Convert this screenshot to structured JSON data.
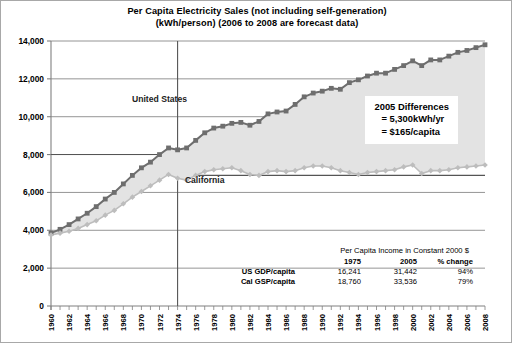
{
  "title": {
    "line1": "Per Capita Electricity Sales (not including self-generation)",
    "line2": "(kWh/person) (2006 to 2008 are forecast data)"
  },
  "callout": {
    "line1": "2005 Differences",
    "line2": "= 5,300kWh/yr",
    "line3": "= $165/capita"
  },
  "income_table": {
    "caption": "Per Capita Income in Constant 2000 $",
    "headers": [
      "1975",
      "2005",
      "% change"
    ],
    "rows": [
      {
        "label": "US GDP/capita",
        "v1975": "16,241",
        "v2005": "31,442",
        "change": "94%"
      },
      {
        "label": "Cal GSP/capita",
        "v1975": "18,760",
        "v2005": "33,536",
        "change": "79%"
      }
    ]
  },
  "colors": {
    "us_series": "#6e6e6e",
    "ca_series": "#bdbdbd",
    "fill_between": "#e3e3e3",
    "axis": "#808080",
    "gridline": "#7a7a7a",
    "frame": "#a8a8a8",
    "text": "#000000"
  },
  "chart_data": {
    "type": "line",
    "title": "Per Capita Electricity Sales (not including self-generation) (kWh/person) (2006 to 2008 are forecast data)",
    "xlabel": "",
    "ylabel": "",
    "xlim": [
      1960,
      2008
    ],
    "ylim": [
      0,
      14000
    ],
    "ytick_step": 2000,
    "yticks": [
      "0",
      "2,000",
      "4,000",
      "6,000",
      "8,000",
      "10,000",
      "12,000",
      "14,000"
    ],
    "xtick_step": 2,
    "xticks": [
      "1960",
      "1962",
      "1964",
      "1966",
      "1968",
      "1970",
      "1972",
      "1974",
      "1976",
      "1978",
      "1980",
      "1982",
      "1984",
      "1986",
      "1988",
      "1990",
      "1992",
      "1994",
      "1996",
      "1998",
      "2000",
      "2002",
      "2004",
      "2006",
      "2008"
    ],
    "grid": "horizontal-partial",
    "legend": "inline-annotations",
    "annotations": [
      {
        "text": "United States",
        "x": 1972,
        "y": 10800
      },
      {
        "text": "California",
        "x": 1977,
        "y": 6500
      }
    ],
    "reference_lines": [
      {
        "orientation": "vertical",
        "x": 1974
      },
      {
        "orientation": "horizontal",
        "y": 8000
      },
      {
        "orientation": "horizontal",
        "y": 6900,
        "x_from": 1976,
        "x_to": 2008
      }
    ],
    "x": [
      1960,
      1961,
      1962,
      1963,
      1964,
      1965,
      1966,
      1967,
      1968,
      1969,
      1970,
      1971,
      1972,
      1973,
      1974,
      1975,
      1976,
      1977,
      1978,
      1979,
      1980,
      1981,
      1982,
      1983,
      1984,
      1985,
      1986,
      1987,
      1988,
      1989,
      1990,
      1991,
      1992,
      1993,
      1994,
      1995,
      1996,
      1997,
      1998,
      1999,
      2000,
      2001,
      2002,
      2003,
      2004,
      2005,
      2006,
      2007,
      2008
    ],
    "series": [
      {
        "name": "United States",
        "marker": "square",
        "color": "#6e6e6e",
        "values": [
          3850,
          4050,
          4300,
          4600,
          4900,
          5250,
          5650,
          6000,
          6450,
          6900,
          7300,
          7600,
          8000,
          8350,
          8250,
          8350,
          8750,
          9150,
          9400,
          9500,
          9650,
          9700,
          9550,
          9750,
          10150,
          10250,
          10300,
          10650,
          11050,
          11250,
          11350,
          11500,
          11450,
          11800,
          11950,
          12150,
          12300,
          12300,
          12500,
          12700,
          12950,
          12700,
          13000,
          13000,
          13200,
          13400,
          13500,
          13650,
          13800
        ]
      },
      {
        "name": "California",
        "marker": "diamond",
        "color": "#bdbdbd",
        "values": [
          3750,
          3850,
          3950,
          4100,
          4300,
          4500,
          4800,
          5050,
          5400,
          5750,
          6050,
          6350,
          6650,
          6950,
          6750,
          6650,
          6900,
          7100,
          7200,
          7250,
          7300,
          7150,
          6950,
          6900,
          7100,
          7150,
          7100,
          7150,
          7300,
          7400,
          7400,
          7300,
          7150,
          7050,
          6950,
          7050,
          7100,
          7150,
          7200,
          7350,
          7450,
          7000,
          7150,
          7150,
          7200,
          7300,
          7350,
          7400,
          7450
        ]
      }
    ]
  }
}
